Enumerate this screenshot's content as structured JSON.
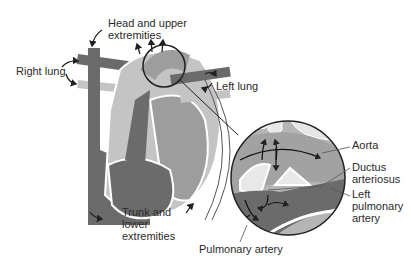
{
  "diagram": {
    "colors": {
      "dark_vessel": "#6b6b6b",
      "medium_vessel": "#9d9d9d",
      "light_vessel": "#c4c4c4",
      "outline": "#222222",
      "background": "#ffffff"
    },
    "labels": {
      "head": "Head and upper\nextremities",
      "right_lung": "Right lung",
      "left_lung": "Left lung",
      "trunk": "Trunk and\nlower\nextremities",
      "aorta": "Aorta",
      "ductus": "Ductus\narteriosus",
      "left_pulmonary": "Left\npulmonary\nartery",
      "pulmonary_artery": "Pulmonary artery"
    }
  }
}
